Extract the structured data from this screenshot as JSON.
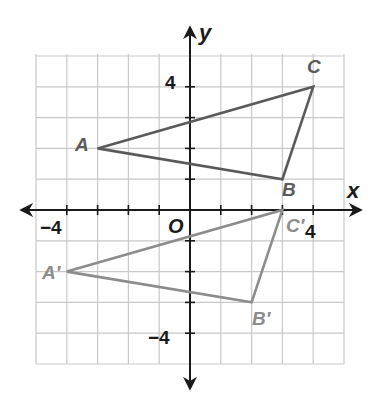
{
  "diagram": {
    "type": "coordinate-plane",
    "axes": {
      "x_label": "x",
      "y_label": "y",
      "origin_label": "O",
      "range": [
        -5,
        5
      ],
      "tick_labels": {
        "x_neg": "−4",
        "x_pos": "4",
        "y_pos": "4",
        "y_neg": "−4"
      }
    },
    "colors": {
      "original": "#5a5a5a",
      "image": "#8c8c8c",
      "grid": "#c8c8c8",
      "axis": "#1a1a1a"
    },
    "triangles": [
      {
        "name": "ABC",
        "vertices": [
          {
            "label": "A",
            "x": -3,
            "y": 2
          },
          {
            "label": "B",
            "x": 3,
            "y": 1
          },
          {
            "label": "C",
            "x": 4,
            "y": 4
          }
        ]
      },
      {
        "name": "A'B'C'",
        "vertices": [
          {
            "label": "A′",
            "x": -4,
            "y": -2
          },
          {
            "label": "B′",
            "x": 2,
            "y": -3
          },
          {
            "label": "C′",
            "x": 3,
            "y": 0
          }
        ]
      }
    ]
  }
}
